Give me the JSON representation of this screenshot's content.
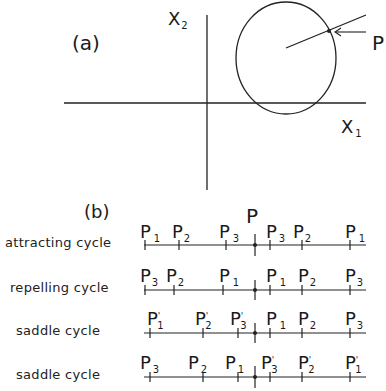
{
  "panel_a": {
    "label": "(a)",
    "axis_x_label": "X",
    "axis_x_sub": "1",
    "axis_y_label": "X",
    "axis_y_sub": "2",
    "point_label": "P"
  },
  "panel_b": {
    "label": "(b)",
    "center_label": "P",
    "rows": [
      {
        "name": "attracting cycle",
        "labels": [
          {
            "base": "P",
            "sub": "1",
            "prime": ""
          },
          {
            "base": "P",
            "sub": "2",
            "prime": ""
          },
          {
            "base": "P",
            "sub": "3",
            "prime": ""
          },
          {
            "base": "P",
            "sub": "3",
            "prime": ""
          },
          {
            "base": "P",
            "sub": "2",
            "prime": ""
          },
          {
            "base": "P",
            "sub": "1",
            "prime": ""
          }
        ]
      },
      {
        "name": "repelling cycle",
        "labels": [
          {
            "base": "P",
            "sub": "3",
            "prime": ""
          },
          {
            "base": "P",
            "sub": "2",
            "prime": ""
          },
          {
            "base": "P",
            "sub": "1",
            "prime": ""
          },
          {
            "base": "P",
            "sub": "1",
            "prime": ""
          },
          {
            "base": "P",
            "sub": "2",
            "prime": ""
          },
          {
            "base": "P",
            "sub": "3",
            "prime": ""
          }
        ]
      },
      {
        "name": "saddle cycle",
        "labels": [
          {
            "base": "P",
            "sub": "1",
            "prime": "'"
          },
          {
            "base": "P",
            "sub": "2",
            "prime": "'"
          },
          {
            "base": "P",
            "sub": "3",
            "prime": "'"
          },
          {
            "base": "P",
            "sub": "1",
            "prime": ""
          },
          {
            "base": "P",
            "sub": "2",
            "prime": ""
          },
          {
            "base": "P",
            "sub": "3",
            "prime": ""
          }
        ]
      },
      {
        "name": "saddle cycle",
        "labels": [
          {
            "base": "P",
            "sub": "3",
            "prime": ""
          },
          {
            "base": "P",
            "sub": "2",
            "prime": ""
          },
          {
            "base": "P",
            "sub": "1",
            "prime": ""
          },
          {
            "base": "P",
            "sub": "3",
            "prime": "'"
          },
          {
            "base": "P",
            "sub": "2",
            "prime": "'"
          },
          {
            "base": "P",
            "sub": "1",
            "prime": "'"
          }
        ]
      }
    ]
  }
}
